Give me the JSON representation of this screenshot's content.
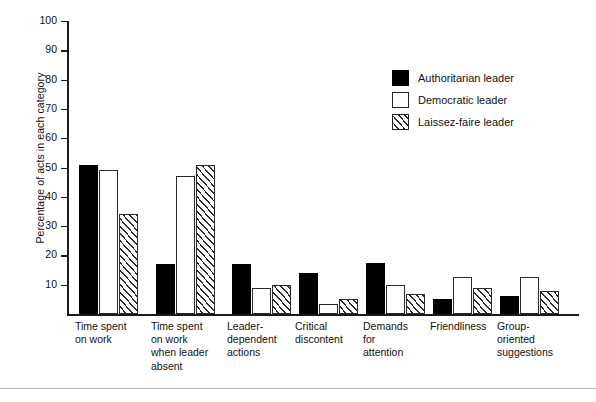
{
  "chart_data": {
    "type": "bar",
    "title": "",
    "xlabel": "",
    "ylabel": "Percentage of acts in each category",
    "ylim": [
      0,
      100
    ],
    "yticks": [
      10,
      20,
      30,
      40,
      50,
      60,
      70,
      80,
      90,
      100
    ],
    "grid": false,
    "legend_position": "upper right",
    "categories": [
      "Time spent on work",
      "Time spent on work when leader absent",
      "Leader-dependent actions",
      "Critical discontent",
      "Demands for attention",
      "Friendliness",
      "Group-oriented suggestions"
    ],
    "category_label_lines": [
      [
        "Time spent",
        "on work"
      ],
      [
        "Time spent",
        "on work",
        "when leader",
        "absent"
      ],
      [
        "Leader-",
        "dependent",
        "actions"
      ],
      [
        "Critical",
        "discontent"
      ],
      [
        "Demands",
        "for",
        "attention"
      ],
      [
        "Friendliness"
      ],
      [
        "Group-",
        "oriented",
        "suggestions"
      ]
    ],
    "series": [
      {
        "name": "Authoritarian leader",
        "fill": "solid",
        "color": "#000000",
        "values": [
          51,
          17,
          17,
          14,
          17.5,
          5,
          6
        ]
      },
      {
        "name": "Democratic leader",
        "fill": "open",
        "color": "#ffffff",
        "values": [
          49,
          47,
          9,
          3.5,
          10,
          12.5,
          12.5
        ]
      },
      {
        "name": "Laissez-faire leader",
        "fill": "hatch",
        "color": "#ffffff",
        "values": [
          34,
          51,
          10,
          5,
          7,
          9,
          8
        ]
      }
    ]
  },
  "legend": {
    "items": [
      {
        "label": "Authoritarian leader",
        "fill": "solid"
      },
      {
        "label": "Democratic leader",
        "fill": "open"
      },
      {
        "label": "Laissez-faire leader",
        "fill": "hatch"
      }
    ]
  },
  "footer": {
    "caption": ""
  }
}
